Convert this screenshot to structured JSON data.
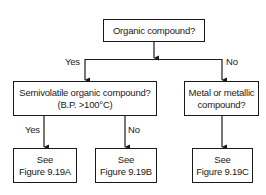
{
  "diagram": {
    "type": "decision-flowchart",
    "nodes": {
      "root": {
        "lines": [
          "Organic compound?"
        ]
      },
      "semivolatile": {
        "lines": [
          "Semivolatile organic compound?",
          "(B.P. >100°C)"
        ]
      },
      "metal": {
        "lines": [
          "Metal or metallic",
          "compound?"
        ]
      },
      "fig_a": {
        "lines": [
          "See",
          "Figure 9.19A"
        ]
      },
      "fig_b": {
        "lines": [
          "See",
          "Figure 9.19B"
        ]
      },
      "fig_c": {
        "lines": [
          "See",
          "Figure 9.19C"
        ]
      }
    },
    "edge_labels": {
      "root_yes": "Yes",
      "root_no": "No",
      "semi_yes": "Yes",
      "semi_no": "No"
    },
    "edges": [
      {
        "from": "root",
        "to": "semivolatile",
        "label": "Yes"
      },
      {
        "from": "root",
        "to": "metal",
        "label": "No"
      },
      {
        "from": "semivolatile",
        "to": "fig_a",
        "label": "Yes"
      },
      {
        "from": "semivolatile",
        "to": "fig_b",
        "label": "No"
      },
      {
        "from": "metal",
        "to": "fig_c",
        "label": ""
      }
    ],
    "colors": {
      "line": "#1a1a1a",
      "background": "#ffffff"
    }
  }
}
